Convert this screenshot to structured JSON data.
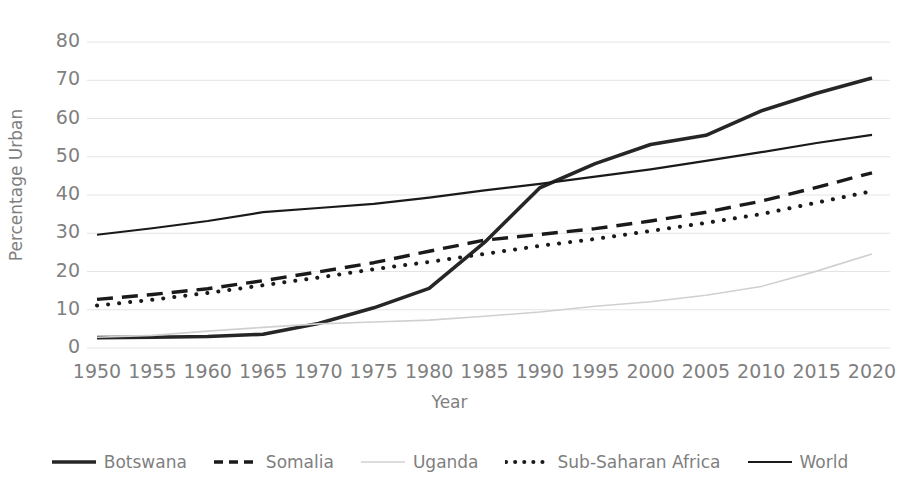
{
  "chart_data": {
    "type": "line",
    "title": "",
    "xlabel": "Year",
    "ylabel": "Percentage Urban",
    "xlim": [
      1950,
      2020
    ],
    "ylim": [
      0,
      80
    ],
    "grid": "horizontal",
    "legend_position": "bottom",
    "x": [
      1950,
      1955,
      1960,
      1965,
      1970,
      1975,
      1980,
      1985,
      1990,
      1995,
      2000,
      2005,
      2010,
      2015,
      2020
    ],
    "xtick_labels": [
      "1950",
      "1955",
      "1960",
      "1965",
      "1970",
      "1975",
      "1980",
      "1985",
      "1990",
      "1995",
      "2000",
      "2005",
      "2010",
      "2015",
      "2020"
    ],
    "ytick_labels": [
      "0",
      "10",
      "20",
      "30",
      "40",
      "50",
      "60",
      "70",
      "80"
    ],
    "ytick_values": [
      0,
      10,
      20,
      30,
      40,
      50,
      60,
      70,
      80
    ],
    "series": [
      {
        "name": "Botswana",
        "style": "solid-thick",
        "color": "#262626",
        "values": [
          2.7,
          2.8,
          3.0,
          3.6,
          6.4,
          10.5,
          15.6,
          27.6,
          41.9,
          48.2,
          53.2,
          55.6,
          62.0,
          66.6,
          70.6
        ]
      },
      {
        "name": "Somalia",
        "style": "dashed",
        "color": "#1a1a1a",
        "values": [
          12.7,
          14.0,
          15.5,
          17.6,
          19.9,
          22.3,
          25.3,
          28.2,
          29.7,
          31.2,
          33.2,
          35.5,
          38.4,
          42.0,
          45.8
        ]
      },
      {
        "name": "Uganda",
        "style": "solid-light",
        "color": "#d0d0d0",
        "values": [
          2.8,
          3.3,
          4.4,
          5.4,
          6.3,
          6.8,
          7.3,
          8.3,
          9.4,
          10.9,
          12.1,
          13.8,
          16.1,
          20.1,
          24.6
        ]
      },
      {
        "name": "Sub-Saharan Africa",
        "style": "dotted",
        "color": "#1a1a1a",
        "values": [
          11.1,
          12.6,
          14.4,
          16.4,
          18.4,
          20.6,
          22.5,
          24.6,
          26.7,
          28.5,
          30.6,
          32.7,
          35.0,
          38.0,
          41.0
        ]
      },
      {
        "name": "World",
        "style": "solid",
        "color": "#1a1a1a",
        "values": [
          29.6,
          31.3,
          33.2,
          35.5,
          36.6,
          37.7,
          39.3,
          41.2,
          42.9,
          44.8,
          46.7,
          48.9,
          51.2,
          53.6,
          55.7
        ]
      }
    ]
  },
  "legend": {
    "items": [
      {
        "label": "Botswana"
      },
      {
        "label": "Somalia"
      },
      {
        "label": "Uganda"
      },
      {
        "label": "Sub-Saharan Africa"
      },
      {
        "label": "World"
      }
    ]
  },
  "colors": {
    "axis_text": "#7f7f7f",
    "gridline": "#e4e4e4",
    "background": "#ffffff"
  }
}
